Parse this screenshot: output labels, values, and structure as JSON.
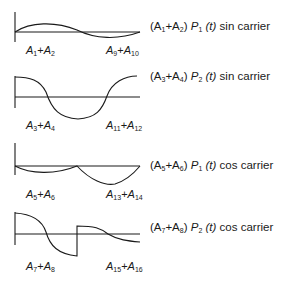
{
  "panels": [
    {
      "id": "p1",
      "caption": {
        "coef_a": "3",
        "pre": "(A",
        "a": "1",
        "plus": "+A",
        "b": "2",
        "post": ")",
        "p": "P",
        "p_sub": "1",
        "t": "(t)",
        "rest": "sin carrier"
      },
      "left_label": {
        "a": "1",
        "b": "2"
      },
      "right_label": {
        "a": "9",
        "b": "10"
      },
      "waveform": "one-cycle sine, low amplitude: positive half then negative half"
    },
    {
      "id": "p2",
      "caption": {
        "pre": "(A",
        "a": "3",
        "plus": "+A",
        "b": "4",
        "post": ")",
        "p": "P",
        "p_sub": "2",
        "t": "(t)",
        "rest": "sin carrier"
      },
      "left_label": {
        "a": "3",
        "b": "4"
      },
      "right_label": {
        "a": "11",
        "b": "12"
      },
      "waveform": "cosine-like: starts high, dips negative, returns high"
    },
    {
      "id": "p3",
      "caption": {
        "pre": "(A",
        "a": "5",
        "plus": "+A",
        "b": "6",
        "post": ")",
        "p": "P",
        "p_sub": "1",
        "t": "(t)",
        "rest": "cos carrier"
      },
      "left_label": {
        "a": "5",
        "b": "6"
      },
      "right_label": {
        "a": "13",
        "b": "14"
      },
      "waveform": "two negative half-arcs, second deeper"
    },
    {
      "id": "p4",
      "caption": {
        "pre": "(A",
        "a": "7",
        "plus": "+A",
        "b": "8",
        "post": ")",
        "p": "P",
        "p_sub": "2",
        "t": "(t)",
        "rest": "cos carrier"
      },
      "left_label": {
        "a": "7",
        "b": "8"
      },
      "right_label": {
        "a": "15",
        "b": "16"
      },
      "waveform": "starts high, falls negative, jumps back up at midpoint, decays below axis"
    }
  ],
  "label_prefix": "A",
  "plus_sign": "+"
}
